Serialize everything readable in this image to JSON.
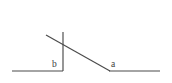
{
  "figure": {
    "kind": "geometry-angle-diagram",
    "background_color": "#ffffff",
    "stroke_color": "#4a4a4a",
    "label_color": "#3c3c3c",
    "width": 172,
    "height": 83
  },
  "labels": {
    "angle_b": "b",
    "angle_a": "a"
  },
  "segments": {
    "left_ray": {
      "x1": 12,
      "y1": 71,
      "x2": 63,
      "y2": 71
    },
    "vertical": {
      "x1": 63,
      "y1": 32,
      "x2": 63,
      "y2": 71
    },
    "transversal": {
      "x1": 46,
      "y1": 35,
      "x2": 110,
      "y2": 71
    },
    "right_ray": {
      "x1": 109,
      "y1": 71,
      "x2": 160,
      "y2": 71
    }
  },
  "label_positions": {
    "angle_b": {
      "x": 52,
      "y": 67
    },
    "angle_a": {
      "x": 111,
      "y": 67
    }
  }
}
